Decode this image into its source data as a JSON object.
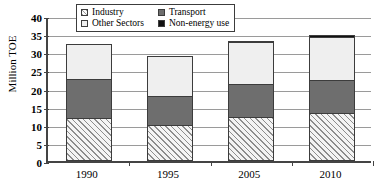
{
  "chart_data": {
    "type": "bar",
    "stacked": true,
    "title": "",
    "xlabel": "",
    "ylabel": "Million TOE",
    "ylim": [
      0,
      40
    ],
    "yticks": [
      0,
      5,
      10,
      15,
      20,
      25,
      30,
      35,
      40
    ],
    "ytick_labels": [
      "0",
      "5",
      "10",
      "15",
      "20",
      "25",
      "30",
      "35",
      "40"
    ],
    "grid": true,
    "legend_position": "top-center",
    "categories": [
      "1990",
      "1995",
      "2005",
      "2010"
    ],
    "series": [
      {
        "name": "Industry",
        "key": "industry",
        "color": "#f4f4f4",
        "pattern": "diagonal-hatch",
        "values": [
          11.9,
          9.9,
          12.1,
          13.2
        ]
      },
      {
        "name": "Transport",
        "key": "transport",
        "color": "#6e6e6e",
        "pattern": "solid",
        "values": [
          11.0,
          8.3,
          9.4,
          9.4
        ]
      },
      {
        "name": "Other Sectors",
        "key": "other",
        "color": "#efefef",
        "pattern": "solid",
        "values": [
          10.0,
          11.3,
          11.8,
          12.3
        ]
      },
      {
        "name": "Non-energy use",
        "key": "nonenergy",
        "color": "#111111",
        "pattern": "solid",
        "values": [
          0.0,
          0.0,
          0.6,
          0.6
        ]
      }
    ],
    "totals": [
      32.9,
      29.5,
      33.9,
      35.5
    ]
  },
  "legend": {
    "items": [
      {
        "label": "Industry",
        "swatch": "industry-swatch"
      },
      {
        "label": "Transport",
        "swatch": "transport-swatch"
      },
      {
        "label": "Other Sectors",
        "swatch": "other-sectors-swatch"
      },
      {
        "label": "Non-energy use",
        "swatch": "non-energy-use-swatch"
      }
    ]
  }
}
